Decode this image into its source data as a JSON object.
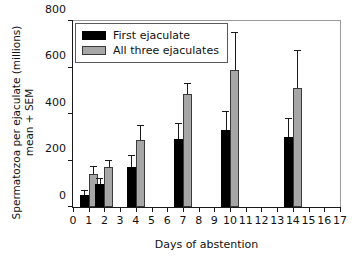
{
  "chart_data": {
    "type": "bar",
    "title": "",
    "xlabel": "Days of abstention",
    "ylabel_line1": "Spermatozoa per ejaculate (millions)",
    "ylabel_line2": "mean + SEM",
    "xlim": [
      0,
      17
    ],
    "ylim": [
      0,
      800
    ],
    "yticks": [
      0,
      200,
      400,
      600,
      800
    ],
    "xticks": [
      0,
      1,
      2,
      3,
      4,
      5,
      6,
      7,
      8,
      9,
      10,
      11,
      12,
      13,
      14,
      15,
      16,
      17
    ],
    "grid": false,
    "legend_position": "top-left",
    "categories": [
      1,
      2,
      4,
      7,
      10,
      14
    ],
    "series": [
      {
        "name": "First ejaculate",
        "color": "#000000",
        "values": [
          50,
          98,
          172,
          293,
          330,
          300
        ],
        "errors": [
          18,
          22,
          48,
          62,
          80,
          78
        ]
      },
      {
        "name": "All three ejaculates",
        "color": "#a6a6a6",
        "values": [
          140,
          172,
          288,
          488,
          590,
          510
        ],
        "errors": [
          32,
          28,
          62,
          42,
          160,
          162
        ]
      }
    ]
  }
}
